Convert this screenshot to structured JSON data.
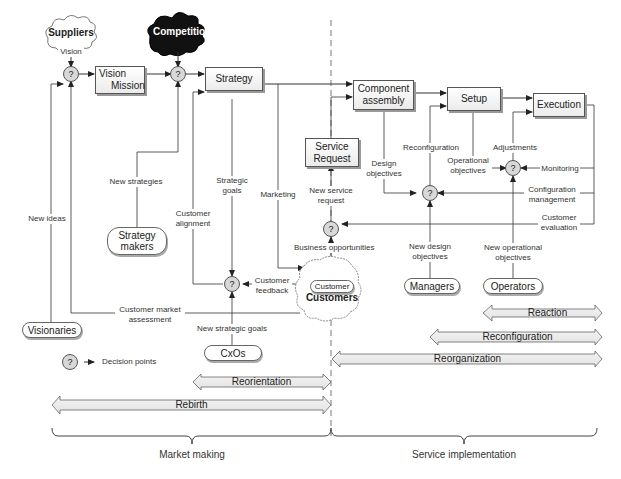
{
  "clouds": {
    "suppliers": "Suppliers",
    "competition": "Competition",
    "customers": "Customers"
  },
  "boxes": {
    "vision_mission_line1": "Vision",
    "vision_mission_line2": "Mission",
    "strategy": "Strategy",
    "component_assembly_line1": "Component",
    "component_assembly_line2": "assembly",
    "setup": "Setup",
    "execution": "Execution",
    "service_request_line1": "Service",
    "service_request_line2": "Request"
  },
  "actors": {
    "strategy_makers_line1": "Strategy",
    "strategy_makers_line2": "makers",
    "visionaries": "Visionaries",
    "cxos": "CxOs",
    "managers": "Managers",
    "operators": "Operators",
    "customer": "Customer"
  },
  "decision_symbol": "?",
  "flow_labels": {
    "vision": "Vision",
    "new_ideas": "New ideas",
    "new_strategies": "New strategies",
    "strategic_goals_line1": "Strategic",
    "strategic_goals_line2": "goals",
    "marketing": "Marketing",
    "customer_alignment_line1": "Customer",
    "customer_alignment_line2": "alignment",
    "customer_feedback_line1": "Customer",
    "customer_feedback_line2": "feedback",
    "customer_market_assessment_line1": "Customer market",
    "customer_market_assessment_line2": "assessment",
    "new_strategic_goals": "New strategic goals",
    "new_service_request_line1": "New service",
    "new_service_request_line2": "request",
    "business_opportunities": "Business opportunities",
    "design_objectives_line1": "Design",
    "design_objectives_line2": "objectives",
    "reconfiguration": "Reconfiguration",
    "operational_objectives_line1": "Operational",
    "operational_objectives_line2": "objectives",
    "adjustments": "Adjustments",
    "monitoring": "Monitoring",
    "configuration_management_line1": "Configuration",
    "configuration_management_line2": "management",
    "customer_evaluation_line1": "Customer",
    "customer_evaluation_line2": "evaluation",
    "new_design_objectives_line1": "New design",
    "new_design_objectives_line2": "objectives",
    "new_operational_objectives_line1": "New operational",
    "new_operational_objectives_line2": "objectives"
  },
  "legend": {
    "decision_points": "Decision points"
  },
  "bands": [
    {
      "label": "Reaction"
    },
    {
      "label": "Reconfiguration"
    },
    {
      "label": "Reorganization"
    },
    {
      "label": "Reorientation"
    },
    {
      "label": "Rebirth"
    }
  ],
  "braces": {
    "market_making": "Market making",
    "service_implementation": "Service implementation"
  }
}
